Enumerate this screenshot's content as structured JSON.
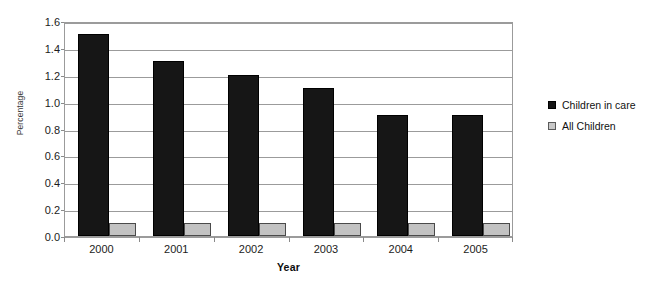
{
  "chart_data": {
    "type": "bar",
    "title": "",
    "subtitle": "",
    "xlabel": "Year",
    "ylabel": "Percentage",
    "categories": [
      "2000",
      "2001",
      "2002",
      "2003",
      "2004",
      "2005"
    ],
    "series": [
      {
        "name": "Children in care",
        "color": "#161616",
        "values": [
          1.5,
          1.3,
          1.2,
          1.1,
          0.9,
          0.9
        ]
      },
      {
        "name": "All Children",
        "color": "#c2c2c2",
        "values": [
          0.1,
          0.1,
          0.1,
          0.1,
          0.1,
          0.1
        ]
      }
    ],
    "ylim": [
      0.0,
      1.6
    ],
    "ytick_step": 0.2,
    "yticks": [
      "0.0",
      "0.2",
      "0.4",
      "0.6",
      "0.8",
      "1.0",
      "1.2",
      "1.4",
      "1.6"
    ],
    "grid": true,
    "grid_axis": "y",
    "legend_position": "right",
    "annotations": []
  }
}
